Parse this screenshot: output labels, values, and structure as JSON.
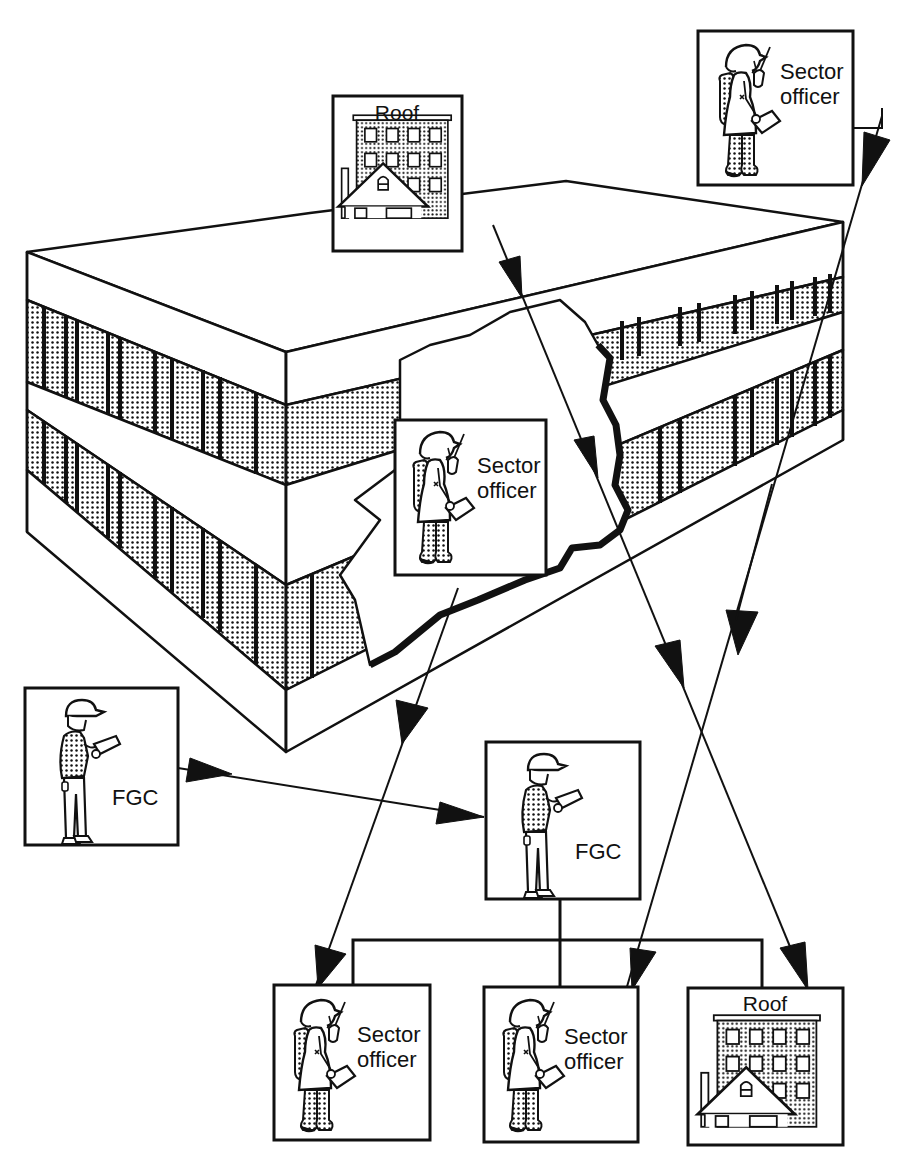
{
  "diagram": {
    "colors": {
      "ink": "#111111",
      "paper": "#ffffff",
      "stipple": "#111111"
    },
    "nodes": {
      "roof_top": {
        "label": "Roof",
        "icon": "building-house-icon"
      },
      "sector_top_right": {
        "label_line1": "Sector",
        "label_line2": "officer",
        "icon": "firefighter-radio-icon"
      },
      "sector_inside": {
        "label_line1": "Sector",
        "label_line2": "officer",
        "icon": "firefighter-radio-icon"
      },
      "fgc_left": {
        "label": "FGC",
        "icon": "commander-clipboard-icon"
      },
      "fgc_center": {
        "label": "FGC",
        "icon": "commander-clipboard-icon"
      },
      "sector_bottom_left": {
        "label_line1": "Sector",
        "label_line2": "officer",
        "icon": "firefighter-radio-icon"
      },
      "sector_bottom_mid": {
        "label_line1": "Sector",
        "label_line2": "officer",
        "icon": "firefighter-radio-icon"
      },
      "roof_bottom_right": {
        "label": "Roof",
        "icon": "building-house-icon"
      }
    },
    "edges": [
      {
        "from": "fgc_left",
        "to": "fgc_center"
      },
      {
        "from": "roof_top",
        "to": "roof_bottom_right"
      },
      {
        "from": "sector_top_right",
        "to": "sector_bottom_mid"
      },
      {
        "from": "sector_inside",
        "to": "sector_bottom_left"
      },
      {
        "from": "fgc_center",
        "to": [
          "sector_bottom_left",
          "sector_bottom_mid",
          "roof_bottom_right"
        ],
        "type": "org-tree"
      }
    ]
  }
}
